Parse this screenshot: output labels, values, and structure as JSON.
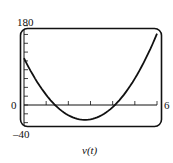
{
  "chart_data": {
    "type": "line",
    "title": "",
    "caption": "v(t)",
    "xlabel": "",
    "ylabel": "",
    "xlim": [
      0,
      6
    ],
    "ylim": [
      -40,
      180
    ],
    "x_tick_step": 1,
    "y_tick_step": 20,
    "tick_labels": {
      "y_max": "180",
      "y_min": "-40",
      "y_zero": "0",
      "x_max": "6"
    },
    "grid": false,
    "series": [
      {
        "name": "v(t)",
        "x": [
          0,
          0.5,
          1,
          1.33,
          1.5,
          2,
          2.5,
          2.67,
          3,
          3.5,
          4,
          4.5,
          5,
          5.5,
          6
        ],
        "values": [
          108,
          72,
          42,
          26,
          18,
          0,
          -14,
          -16,
          -13,
          -6,
          0,
          18,
          42,
          72,
          180
        ]
      }
    ]
  },
  "labels": {
    "y_max": "180",
    "y_zero": "0",
    "y_min": "–40",
    "x_max": "6",
    "caption": "v(t)"
  }
}
